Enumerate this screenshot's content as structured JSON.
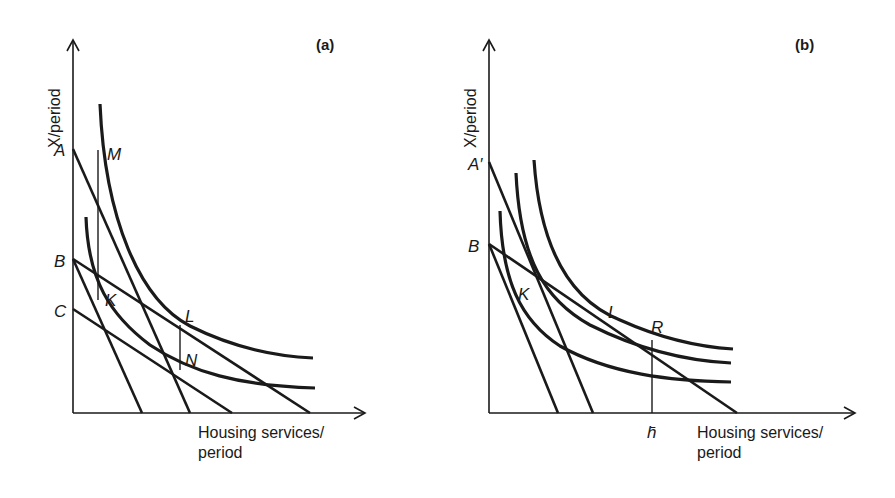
{
  "diagram": {
    "panels": [
      {
        "id": "a",
        "title": "(a)",
        "y_axis_label": "X/period",
        "x_axis_label_line1": "Housing services/",
        "x_axis_label_line2": "period",
        "budget_line_labels": [
          "A",
          "B",
          "C"
        ],
        "point_labels": [
          "M",
          "K",
          "L",
          "N"
        ]
      },
      {
        "id": "b",
        "title": "(b)",
        "y_axis_label": "X/period",
        "x_axis_label_line1": "Housing services/",
        "x_axis_label_line2": "period",
        "budget_line_labels": [
          "A′",
          "B"
        ],
        "point_labels": [
          "K",
          "L",
          "R"
        ],
        "x_marker": "h̄"
      }
    ]
  }
}
